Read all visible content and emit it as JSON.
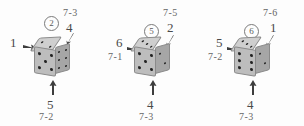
{
  "figure": {
    "colors": {
      "die_top": "#cfcfcf",
      "die_front": "#bdbdbd",
      "die_right": "#a6a6a6",
      "pip": "#222222",
      "text": "#555555",
      "background": "#ffffff"
    }
  },
  "dice": [
    {
      "id": "die-1",
      "badge": "2",
      "faces": {
        "top": 2,
        "front": 5,
        "right": 6
      },
      "labels": {
        "left_value": "1",
        "left_expr": "",
        "top_right_expr": "7-3",
        "top_right_value": "4",
        "bottom_value": "5",
        "bottom_expr": "7-2"
      }
    },
    {
      "id": "die-2",
      "badge": "5",
      "faces": {
        "top": 3,
        "front": 5,
        "right": 2
      },
      "labels": {
        "left_value": "6",
        "left_expr": "7-1",
        "top_right_expr": "7-5",
        "top_right_value": "2",
        "bottom_value": "4",
        "bottom_expr": "7-3"
      }
    },
    {
      "id": "die-3",
      "badge": "6",
      "faces": {
        "top": 3,
        "front": 6,
        "right": 2
      },
      "labels": {
        "left_value": "5",
        "left_expr": "7-2",
        "top_right_expr": "7-6",
        "top_right_value": "1",
        "bottom_value": "4",
        "bottom_expr": "7-3"
      }
    }
  ]
}
